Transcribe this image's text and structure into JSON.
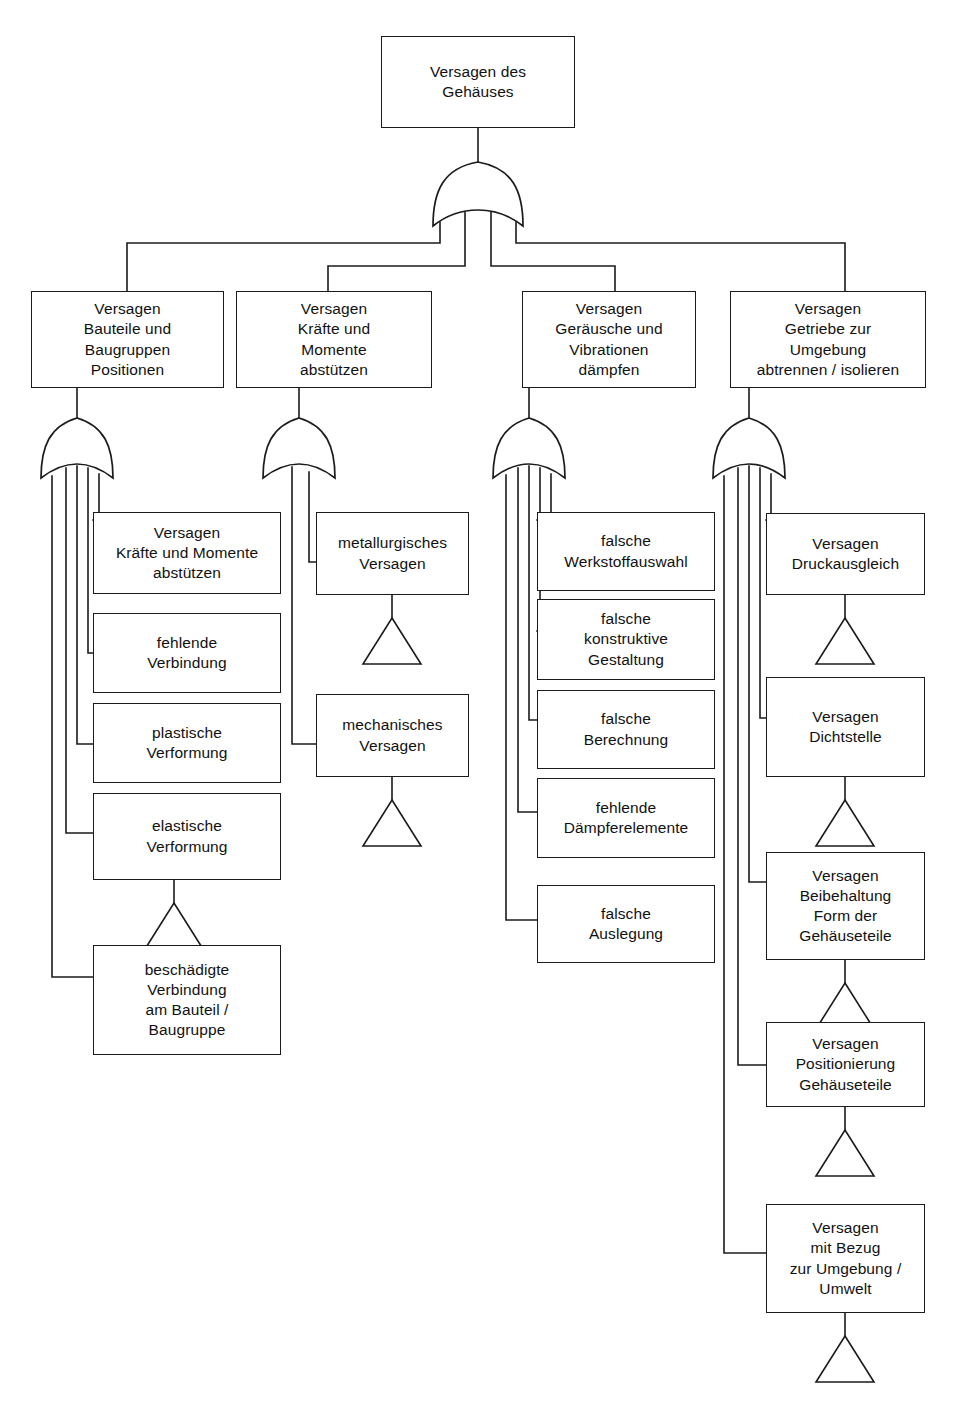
{
  "diagram": {
    "language": "de",
    "line_color": "#1b1b1b",
    "box_fill": "#ffffff",
    "gate_symbol": "or-gate",
    "transfer_symbol": "triangle"
  },
  "top": {
    "label": "Versagen des\nGehäuses"
  },
  "level2": [
    {
      "label": "Versagen\nBauteile und\nBaugruppen\nPositionen"
    },
    {
      "label": "Versagen\nKräfte und\nMomente\nabstützen"
    },
    {
      "label": "Versagen\nGeräusche und\nVibrationen\ndämpfen"
    },
    {
      "label": "Versagen\nGetriebe zur\nUmgebung\nabtrennen / isolieren"
    }
  ],
  "col1": {
    "gate_outputs": 5,
    "items": [
      {
        "label": "Versagen\nKräfte und Momente\nabstützen"
      },
      {
        "label": "fehlende\nVerbindung"
      },
      {
        "label": "plastische\nVerformung"
      },
      {
        "label": "elastische\nVerformung"
      },
      {
        "label": "beschädigte\nVerbindung\nam Bauteil /\nBaugruppe"
      }
    ]
  },
  "col2": {
    "gate_outputs": 2,
    "items": [
      {
        "label": "metallurgisches\nVersagen"
      },
      {
        "label": "mechanisches\nVersagen"
      }
    ]
  },
  "col3": {
    "gate_outputs": 5,
    "items": [
      {
        "label": "falsche\nWerkstoffauswahl"
      },
      {
        "label": "falsche\nkonstruktive\nGestaltung"
      },
      {
        "label": "falsche\nBerechnung"
      },
      {
        "label": "fehlende\nDämpferelemente"
      },
      {
        "label": "falsche\nAuslegung"
      }
    ]
  },
  "col4": {
    "gate_outputs": 5,
    "items": [
      {
        "label": "Versagen\nDruckausgleich"
      },
      {
        "label": "Versagen\nDichtstelle"
      },
      {
        "label": "Versagen\nBeibehaltung\nForm der\nGehäuseteile"
      },
      {
        "label": "Versagen\nPositionierung\nGehäuseteile"
      },
      {
        "label": "Versagen\nmit Bezug\nzur Umgebung /\nUmwelt"
      }
    ]
  },
  "footer": {
    "faint_text": ""
  }
}
